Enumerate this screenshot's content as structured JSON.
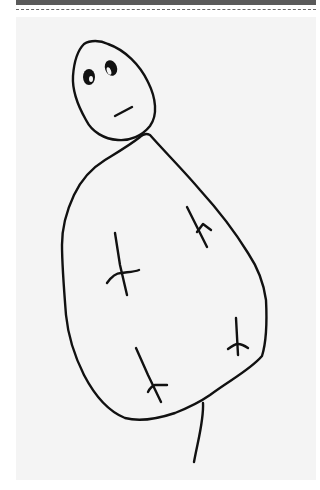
{
  "image": {
    "description": "Child-like line drawing of a figure with an oval head, two eyes, a mouth, and a large pear-shaped body with four small branch marks and a single leg",
    "colors": {
      "paper": "#f4f4f4",
      "ink": "#111111",
      "top_bar": "#5a5a5a"
    }
  }
}
